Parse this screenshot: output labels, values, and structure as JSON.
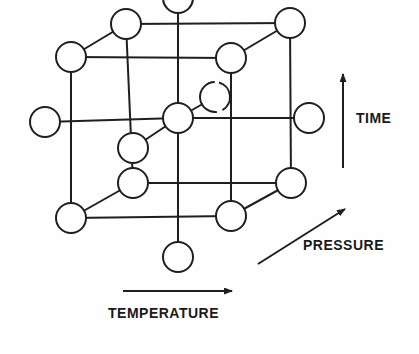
{
  "diagram": {
    "type": "unit-cell-lattice",
    "title": "",
    "stroke_color": "#1f1f1f",
    "fill_color": "#ffffff",
    "background_color": "#fefefe",
    "node_radius": 15,
    "axes": [
      {
        "id": "time",
        "label": "TIME",
        "direction": "up",
        "x": 356,
        "y": 110
      },
      {
        "id": "pressure",
        "label": "PRESSURE",
        "direction": "up-right",
        "x": 303,
        "y": 237
      },
      {
        "id": "temperature",
        "label": "TEMPERATURE",
        "direction": "right",
        "x": 108,
        "y": 305
      }
    ],
    "arrows": [
      {
        "id": "time-arrow",
        "x1": 343,
        "y1": 168,
        "x2": 343,
        "y2": 74
      },
      {
        "id": "pressure-arrow",
        "x1": 258,
        "y1": 264,
        "x2": 345,
        "y2": 209
      },
      {
        "id": "temperature-arrow",
        "x1": 123,
        "y1": 291,
        "x2": 232,
        "y2": 291
      }
    ],
    "nodes": [
      {
        "id": "top-center",
        "cx": 178,
        "cy": -2,
        "r": 15,
        "gaps": []
      },
      {
        "id": "back-top-left",
        "cx": 126,
        "cy": 24,
        "r": 15,
        "gaps": []
      },
      {
        "id": "back-top-right",
        "cx": 290,
        "cy": 23,
        "r": 15,
        "gaps": []
      },
      {
        "id": "front-top-left",
        "cx": 71,
        "cy": 57,
        "r": 15,
        "gaps": []
      },
      {
        "id": "front-top-right",
        "cx": 231,
        "cy": 58,
        "r": 15,
        "gaps": []
      },
      {
        "id": "face-back-center",
        "cx": 215,
        "cy": 97,
        "r": 15,
        "gaps": [
          "top",
          "bottom-right"
        ]
      },
      {
        "id": "face-left",
        "cx": 45,
        "cy": 122,
        "r": 15,
        "gaps": []
      },
      {
        "id": "body-center",
        "cx": 178,
        "cy": 118,
        "r": 15,
        "gaps": []
      },
      {
        "id": "face-right",
        "cx": 309,
        "cy": 118,
        "r": 15,
        "gaps": []
      },
      {
        "id": "face-front-center",
        "cx": 133,
        "cy": 148,
        "r": 15,
        "gaps": []
      },
      {
        "id": "back-bottom-left",
        "cx": 133,
        "cy": 183,
        "r": 15,
        "gaps": []
      },
      {
        "id": "back-bottom-right",
        "cx": 291,
        "cy": 183,
        "r": 15,
        "gaps": []
      },
      {
        "id": "front-bottom-left",
        "cx": 71,
        "cy": 218,
        "r": 15,
        "gaps": []
      },
      {
        "id": "front-bottom-right",
        "cx": 231,
        "cy": 216,
        "r": 15,
        "gaps": []
      },
      {
        "id": "bottom-center",
        "cx": 178,
        "cy": 257,
        "r": 15,
        "gaps": []
      }
    ],
    "edges": [
      {
        "id": "edge-back-top",
        "x1": 126,
        "y1": 24,
        "x2": 290,
        "y2": 23
      },
      {
        "id": "edge-front-top",
        "x1": 71,
        "y1": 57,
        "x2": 231,
        "y2": 58
      },
      {
        "id": "edge-top-left-diag",
        "x1": 71,
        "y1": 57,
        "x2": 126,
        "y2": 24
      },
      {
        "id": "edge-top-right-diag",
        "x1": 231,
        "y1": 58,
        "x2": 290,
        "y2": 23
      },
      {
        "id": "edge-back-bottom",
        "x1": 133,
        "y1": 183,
        "x2": 291,
        "y2": 183
      },
      {
        "id": "edge-front-bottom",
        "x1": 71,
        "y1": 218,
        "x2": 231,
        "y2": 216
      },
      {
        "id": "edge-bot-left-diag",
        "x1": 71,
        "y1": 218,
        "x2": 133,
        "y2": 183
      },
      {
        "id": "edge-bot-right-diag",
        "x1": 231,
        "y1": 216,
        "x2": 291,
        "y2": 183
      },
      {
        "id": "edge-vert-back-left",
        "x1": 126,
        "y1": 24,
        "x2": 133,
        "y2": 183
      },
      {
        "id": "edge-vert-back-right",
        "x1": 290,
        "y1": 23,
        "x2": 291,
        "y2": 183
      },
      {
        "id": "edge-vert-front-left",
        "x1": 71,
        "y1": 57,
        "x2": 71,
        "y2": 218
      },
      {
        "id": "edge-vert-front-right",
        "x1": 231,
        "y1": 58,
        "x2": 231,
        "y2": 216
      },
      {
        "id": "edge-center-vert-up",
        "x1": 178,
        "y1": -2,
        "x2": 178,
        "y2": 118
      },
      {
        "id": "edge-center-vert-down",
        "x1": 178,
        "y1": 118,
        "x2": 178,
        "y2": 257
      },
      {
        "id": "edge-center-horiz-left",
        "x1": 45,
        "y1": 122,
        "x2": 178,
        "y2": 118
      },
      {
        "id": "edge-center-horiz-right",
        "x1": 178,
        "y1": 118,
        "x2": 309,
        "y2": 118
      },
      {
        "id": "edge-center-diag-back",
        "x1": 178,
        "y1": 118,
        "x2": 215,
        "y2": 97
      },
      {
        "id": "edge-center-diag-front",
        "x1": 178,
        "y1": 118,
        "x2": 133,
        "y2": 148
      }
    ]
  }
}
